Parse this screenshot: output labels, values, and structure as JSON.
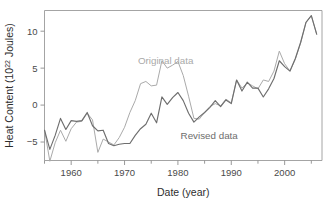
{
  "chart_data": {
    "type": "line",
    "title": "",
    "xlabel": "Date (year)",
    "ylabel": "Heat Content (10^22 Joules)",
    "ylabel_base": "Heat Content (10",
    "ylabel_exponent": "22",
    "ylabel_tail": " Joules)",
    "xlim": [
      1955,
      2007
    ],
    "ylim": [
      -7.5,
      12.8
    ],
    "xticks": [
      1960,
      1970,
      1980,
      1990,
      2000
    ],
    "xtick_labels": [
      "1960",
      "1970",
      "1980",
      "1990",
      "2000"
    ],
    "xminor_ticks": [
      1955,
      1965,
      1975,
      1985,
      1995,
      2005
    ],
    "yticks": [
      -5,
      0,
      5,
      10
    ],
    "ytick_labels": [
      "−5",
      "0",
      "5",
      "10"
    ],
    "grid": false,
    "legend_position": "inline-annotations",
    "annotations": [
      {
        "text": "Original data",
        "x": 1972.5,
        "y": 5.6,
        "color": "#a9a9a9"
      },
      {
        "text": "Revised data",
        "x": 1980.5,
        "y": -4.6,
        "color": "#6d6d6d"
      }
    ],
    "series": [
      {
        "name": "Original data",
        "color": "#aaaaaa",
        "stroke_width": 1.0,
        "x": [
          1955,
          1956,
          1957,
          1958,
          1959,
          1960,
          1961,
          1962,
          1963,
          1964,
          1965,
          1966,
          1967,
          1968,
          1969,
          1970,
          1971,
          1972,
          1973,
          1974,
          1975,
          1976,
          1977,
          1978,
          1979,
          1980,
          1981,
          1982,
          1983,
          1984,
          1985,
          1986,
          1987,
          1988,
          1989,
          1990,
          1991,
          1992,
          1993,
          1994,
          1995,
          1996,
          1997,
          1998,
          1999,
          2000,
          2001,
          2002,
          2003,
          2004,
          2005,
          2006
        ],
        "values": [
          -3.3,
          -7.6,
          -5.1,
          -3.4,
          -4.9,
          -3.2,
          -2.3,
          -2.2,
          -1.1,
          -2.0,
          -6.4,
          -4.6,
          -5.0,
          -5.4,
          -4.4,
          -3.0,
          -1.0,
          0.6,
          2.9,
          3.2,
          2.6,
          2.7,
          6.0,
          5.0,
          5.4,
          5.9,
          4.0,
          1.2,
          -1.8,
          -1.9,
          -1.0,
          -0.2,
          0.2,
          -0.1,
          0.8,
          0.3,
          3.4,
          2.3,
          3.0,
          2.6,
          2.2,
          3.4,
          3.2,
          4.6,
          7.3,
          5.6,
          4.6,
          6.2,
          8.4,
          11.2,
          12.1,
          9.6
        ]
      },
      {
        "name": "Revised data",
        "color": "#6e6e6e",
        "stroke_width": 1.15,
        "x": [
          1955,
          1956,
          1957,
          1958,
          1959,
          1960,
          1961,
          1962,
          1963,
          1964,
          1965,
          1966,
          1967,
          1968,
          1969,
          1970,
          1971,
          1972,
          1973,
          1974,
          1975,
          1976,
          1977,
          1978,
          1979,
          1980,
          1981,
          1982,
          1983,
          1984,
          1985,
          1986,
          1987,
          1988,
          1989,
          1990,
          1991,
          1992,
          1993,
          1994,
          1995,
          1996,
          1997,
          1998,
          1999,
          2000,
          2001,
          2002,
          2003,
          2004,
          2005,
          2006
        ],
        "values": [
          -3.4,
          -6.0,
          -4.1,
          -1.8,
          -3.3,
          -2.1,
          -2.2,
          -2.1,
          -1.0,
          -2.8,
          -3.5,
          -3.4,
          -5.2,
          -5.5,
          -5.3,
          -5.2,
          -5.2,
          -4.1,
          -3.2,
          -2.6,
          -1.1,
          -2.4,
          1.1,
          0.1,
          1.0,
          1.7,
          0.6,
          -1.1,
          -2.3,
          -1.6,
          -1.0,
          -0.3,
          0.6,
          -0.2,
          0.7,
          0.2,
          3.4,
          1.9,
          3.1,
          2.3,
          2.3,
          1.1,
          2.2,
          3.6,
          6.0,
          5.2,
          4.6,
          6.3,
          8.5,
          11.2,
          12.1,
          9.6
        ]
      }
    ]
  }
}
